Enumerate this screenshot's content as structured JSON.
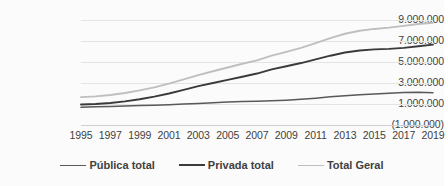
{
  "chart_data": {
    "type": "line",
    "title": "",
    "xlabel": "",
    "ylabel": "",
    "grid": true,
    "legend_position": "bottom",
    "x": [
      1995,
      1996,
      1997,
      1998,
      1999,
      2000,
      2001,
      2002,
      2003,
      2004,
      2005,
      2006,
      2007,
      2008,
      2009,
      2010,
      2011,
      2012,
      2013,
      2014,
      2015,
      2016,
      2017,
      2018,
      2019
    ],
    "xtick_labels": [
      "1995",
      "1997",
      "1999",
      "2001",
      "2003",
      "2005",
      "2007",
      "2009",
      "2011",
      "2013",
      "2015",
      "2017",
      "2019"
    ],
    "ytick_labels": [
      "9.000.000",
      "7.000.000",
      "5.000.000",
      "3.000.000",
      "1.000.000",
      "(1.000.000)"
    ],
    "ytick_values": [
      9000000,
      7000000,
      5000000,
      3000000,
      1000000,
      -1000000
    ],
    "ylim": [
      -1000000,
      9000000
    ],
    "series": [
      {
        "name": "Pública total",
        "color": "#595959",
        "values": [
          700000,
          730000,
          760000,
          800000,
          850000,
          890000,
          940000,
          990000,
          1050000,
          1120000,
          1180000,
          1230000,
          1260000,
          1300000,
          1360000,
          1450000,
          1550000,
          1680000,
          1790000,
          1880000,
          1950000,
          2020000,
          2090000,
          2120000,
          2080000
        ]
      },
      {
        "name": "Privada total",
        "color": "#3a3a3a",
        "values": [
          950000,
          1000000,
          1100000,
          1250000,
          1450000,
          1700000,
          2000000,
          2350000,
          2700000,
          3000000,
          3300000,
          3600000,
          3900000,
          4300000,
          4600000,
          4900000,
          5250000,
          5600000,
          5900000,
          6100000,
          6200000,
          6250000,
          6350000,
          6500000,
          6650000
        ]
      },
      {
        "name": "Total Geral",
        "color": "#bfbfbf",
        "values": [
          1650000,
          1730000,
          1860000,
          2050000,
          2300000,
          2590000,
          2940000,
          3340000,
          3750000,
          4120000,
          4480000,
          4830000,
          5160000,
          5600000,
          5960000,
          6350000,
          6800000,
          7280000,
          7690000,
          7980000,
          8150000,
          8270000,
          8440000,
          8620000,
          8730000
        ]
      }
    ]
  },
  "legend": {
    "items": [
      {
        "label": "Pública total"
      },
      {
        "label": "Privada total"
      },
      {
        "label": "Total Geral"
      }
    ]
  },
  "colors": {
    "background": "#fbfbfb",
    "gridline": "#e4e4e4",
    "axis": "#d0d0d0",
    "text": "#3f3f3f",
    "publica": "#595959",
    "privada": "#3a3a3a",
    "total": "#bfbfbf"
  }
}
